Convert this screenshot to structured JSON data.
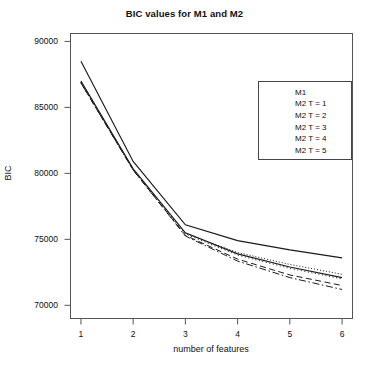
{
  "chart_data": {
    "type": "line",
    "title": "BIC values for M1 and M2",
    "xlabel": "number of features",
    "ylabel": "BIC",
    "x": [
      1,
      2,
      3,
      4,
      5,
      6
    ],
    "xticklabels": [
      "1",
      "2",
      "3",
      "4",
      "5",
      "6"
    ],
    "yticks": [
      70000,
      75000,
      80000,
      85000,
      90000
    ],
    "yticklabels": [
      "70000",
      "75000",
      "80000",
      "85000",
      "90000"
    ],
    "xlim": [
      0.8,
      6.2
    ],
    "ylim": [
      69000,
      90600
    ],
    "grid": false,
    "legend_position": "upper right",
    "series": [
      {
        "name": "M1",
        "style": "solid",
        "values": [
          88500,
          80900,
          76100,
          74900,
          74200,
          73600
        ]
      },
      {
        "name": "M2 T = 1",
        "style": "solid",
        "values": [
          87000,
          80350,
          75500,
          73900,
          72900,
          72100
        ]
      },
      {
        "name": "M2 T = 2",
        "style": "dotted",
        "values": [
          86900,
          80300,
          75450,
          74000,
          73100,
          72350
        ]
      },
      {
        "name": "M2 T = 3",
        "style": "dotted-fine",
        "values": [
          86900,
          80300,
          75400,
          73800,
          72800,
          72000
        ]
      },
      {
        "name": "M2 T = 4",
        "style": "dashed",
        "values": [
          86850,
          80250,
          75300,
          73500,
          72300,
          71500
        ]
      },
      {
        "name": "M2 T = 5",
        "style": "dashdot",
        "values": [
          86850,
          80250,
          75250,
          73350,
          72100,
          71200
        ]
      }
    ]
  },
  "legend": {
    "items": [
      {
        "label": "M1"
      },
      {
        "label": "M2 T = 1"
      },
      {
        "label": "M2 T = 2"
      },
      {
        "label": "M2 T = 3"
      },
      {
        "label": "M2 T = 4"
      },
      {
        "label": "M2 T = 5"
      }
    ]
  },
  "colors": {
    "line": "#1a1a1a",
    "axis": "#555555",
    "background": "#ffffff"
  }
}
